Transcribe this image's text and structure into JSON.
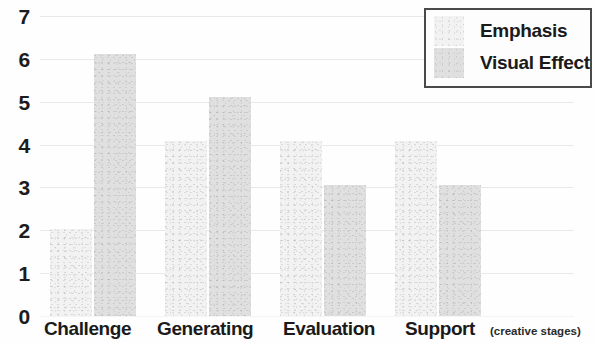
{
  "chart_data": {
    "type": "bar",
    "title": "",
    "xlabel": "(creative stages)",
    "ylabel": "",
    "categories": [
      "Challenge",
      "Generating",
      "Evaluation",
      "Support"
    ],
    "series": [
      {
        "name": "Emphasis",
        "values": [
          2,
          4,
          4,
          4
        ],
        "color": "#f2f2f2"
      },
      {
        "name": "Visual Effect",
        "values": [
          6,
          5,
          3,
          3
        ],
        "color": "#e0e0e0"
      }
    ],
    "ylim": [
      0,
      7
    ],
    "y_ticks": [
      7,
      6,
      5,
      4,
      3,
      2,
      1,
      0
    ],
    "grid": true,
    "legend_position": "top-right"
  },
  "legend": {
    "entries": [
      {
        "label": "Emphasis"
      },
      {
        "label": "Visual Effect"
      }
    ]
  },
  "axes": {
    "y_tick_labels": [
      "7",
      "6",
      "5",
      "4",
      "3",
      "2",
      "1",
      "0"
    ],
    "x_tick_labels": [
      "Challenge",
      "Generating",
      "Evaluation",
      "Support"
    ],
    "x_axis_title": "(creative stages)"
  }
}
